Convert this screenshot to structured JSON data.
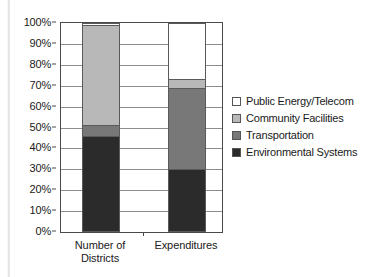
{
  "chart_data": {
    "type": "bar",
    "stacked": true,
    "stack_normalized": true,
    "title": "",
    "subtitle": "",
    "xlabel": "",
    "ylabel": "",
    "ylim": [
      0,
      100
    ],
    "y_tick_labels": [
      "0%",
      "10%",
      "20%",
      "30%",
      "40%",
      "50%",
      "60%",
      "70%",
      "80%",
      "90%",
      "100%"
    ],
    "y_tick_values": [
      0,
      10,
      20,
      30,
      40,
      50,
      60,
      70,
      80,
      90,
      100
    ],
    "grid": true,
    "grid_axis": "y",
    "legend_position": "right",
    "categories": [
      "Number of Districts",
      "Expenditures"
    ],
    "series": [
      {
        "name": "Environmental Systems",
        "color": "#2b2b2b",
        "values": [
          46,
          30
        ]
      },
      {
        "name": "Transportation",
        "color": "#787878",
        "values": [
          5,
          39
        ]
      },
      {
        "name": "Community Facilities",
        "color": "#b8b8b8",
        "values": [
          48,
          4
        ]
      },
      {
        "name": "Public Energy/Telecom",
        "color": "#ffffff",
        "values": [
          1,
          27
        ]
      }
    ],
    "annotations": []
  },
  "legend": {
    "items": [
      {
        "label": "Public Energy/Telecom",
        "swatch": "#ffffff"
      },
      {
        "label": "Community Facilities",
        "swatch": "#b8b8b8"
      },
      {
        "label": "Transportation",
        "swatch": "#787878"
      },
      {
        "label": "Environmental Systems",
        "swatch": "#2b2b2b"
      }
    ]
  },
  "axes": {
    "x_labels": [
      {
        "line1": "Number of",
        "line2": "Districts"
      },
      {
        "line1": "Expenditures",
        "line2": ""
      }
    ]
  }
}
